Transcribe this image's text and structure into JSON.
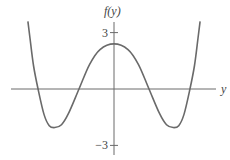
{
  "chart_data": {
    "type": "line",
    "title": "",
    "xlabel": "y",
    "ylabel": "f(y)",
    "yticks": [
      {
        "value": 3,
        "label": "3"
      },
      {
        "value": -3,
        "label": "−3"
      }
    ],
    "xlim": [
      -3.0,
      3.2
    ],
    "ylim": [
      -3.7,
      3.8
    ],
    "grid": false,
    "legend": "none",
    "series": [
      {
        "name": "f(y)",
        "x": [
          -2.46,
          -2.4,
          -2.3,
          -2.17,
          -2.0,
          -1.85,
          -1.69,
          -1.5,
          -1.3,
          -1.0,
          -0.7,
          -0.4,
          0.0,
          0.4,
          0.7,
          1.0,
          1.3,
          1.5,
          1.69,
          1.85,
          2.0,
          2.17,
          2.3,
          2.4,
          2.46
        ],
        "y": [
          3.6,
          2.7,
          1.25,
          0.0,
          -1.35,
          -1.95,
          -2.05,
          -1.9,
          -1.3,
          0.0,
          1.3,
          2.1,
          2.4,
          2.1,
          1.3,
          0.0,
          -1.3,
          -1.9,
          -2.05,
          -1.95,
          -1.35,
          0.0,
          1.25,
          2.7,
          3.6
        ]
      }
    ]
  }
}
